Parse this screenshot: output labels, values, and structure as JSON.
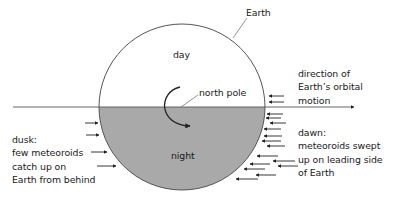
{
  "diagram": {
    "labels": {
      "earth": "Earth",
      "day": "day",
      "night": "night",
      "north_pole": "north pole",
      "orbital_motion": "direction of\nEarth’s orbital\nmotion",
      "dawn": "dawn:\nmeteoroids swept\nup on leading side\nof Earth",
      "dusk": "dusk:\nfew meteoroids\ncatch up on\nEarth from behind"
    },
    "colors": {
      "day_fill": "#ffffff",
      "night_fill": "#a9a9a9",
      "line": "#333333"
    }
  }
}
